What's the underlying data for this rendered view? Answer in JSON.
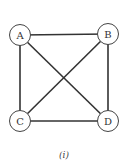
{
  "diagram": {
    "type": "complete-graph",
    "nodes": [
      {
        "id": "A",
        "label": "A",
        "x": 20,
        "y": 35
      },
      {
        "id": "B",
        "label": "B",
        "x": 108,
        "y": 34
      },
      {
        "id": "C",
        "label": "C",
        "x": 20,
        "y": 121
      },
      {
        "id": "D",
        "label": "D",
        "x": 108,
        "y": 121
      }
    ],
    "edges": [
      [
        "A",
        "B"
      ],
      [
        "A",
        "C"
      ],
      [
        "A",
        "D"
      ],
      [
        "B",
        "C"
      ],
      [
        "B",
        "D"
      ],
      [
        "C",
        "D"
      ]
    ],
    "caption": "(i)"
  },
  "colors": {
    "stroke": "#333333",
    "fill": "#ffffff"
  }
}
